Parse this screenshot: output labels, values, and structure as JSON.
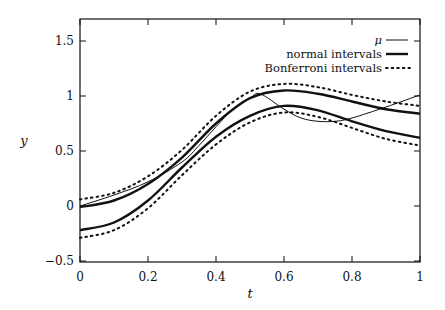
{
  "chart_data": {
    "type": "line",
    "title": "",
    "xlabel": "t",
    "ylabel": "y",
    "xlim": [
      0,
      1
    ],
    "ylim": [
      -0.5,
      1.7
    ],
    "grid": false,
    "legend_position": "upper right",
    "x_ticks": [
      "0",
      "0.2",
      "0.4",
      "0.6",
      "0.8",
      "1"
    ],
    "y_ticks": [
      "-0.5",
      "0",
      "0.5",
      "1",
      "1.5"
    ],
    "legend": [
      {
        "label": "μ",
        "style": "thin-solid"
      },
      {
        "label": "normal intervals",
        "style": "thick-solid"
      },
      {
        "label": "Bonferroni intervals",
        "style": "dotted"
      }
    ],
    "series": [
      {
        "name": "μ",
        "style": "thin-solid",
        "x": [
          0,
          0.1,
          0.2,
          0.3,
          0.35,
          0.4,
          0.45,
          0.5,
          0.53,
          0.6,
          0.65,
          0.7,
          0.75,
          0.8,
          0.9,
          1.0
        ],
        "y": [
          0.0,
          0.1,
          0.22,
          0.4,
          0.55,
          0.72,
          0.88,
          0.98,
          1.02,
          0.88,
          0.8,
          0.77,
          0.77,
          0.8,
          0.9,
          1.01
        ]
      },
      {
        "name": "normal intervals (upper)",
        "style": "thick-solid",
        "x": [
          0,
          0.1,
          0.2,
          0.3,
          0.4,
          0.5,
          0.6,
          0.7,
          0.8,
          0.9,
          1.0
        ],
        "y": [
          -0.01,
          0.05,
          0.2,
          0.44,
          0.75,
          0.98,
          1.05,
          1.02,
          0.95,
          0.88,
          0.84
        ]
      },
      {
        "name": "normal intervals (lower)",
        "style": "thick-solid",
        "x": [
          0,
          0.1,
          0.2,
          0.3,
          0.4,
          0.5,
          0.6,
          0.7,
          0.8,
          0.9,
          1.0
        ],
        "y": [
          -0.22,
          -0.15,
          0.05,
          0.35,
          0.63,
          0.82,
          0.91,
          0.87,
          0.77,
          0.68,
          0.62
        ]
      },
      {
        "name": "Bonferroni intervals (upper)",
        "style": "dotted",
        "x": [
          0,
          0.1,
          0.2,
          0.3,
          0.4,
          0.5,
          0.6,
          0.7,
          0.8,
          0.9,
          1.0
        ],
        "y": [
          0.06,
          0.12,
          0.27,
          0.51,
          0.82,
          1.04,
          1.11,
          1.08,
          1.01,
          0.95,
          0.91
        ]
      },
      {
        "name": "Bonferroni intervals (lower)",
        "style": "dotted",
        "x": [
          0,
          0.1,
          0.2,
          0.3,
          0.4,
          0.5,
          0.6,
          0.7,
          0.8,
          0.9,
          1.0
        ],
        "y": [
          -0.29,
          -0.22,
          -0.02,
          0.28,
          0.56,
          0.76,
          0.85,
          0.81,
          0.71,
          0.61,
          0.55
        ]
      }
    ]
  },
  "labels": {
    "xlabel": "t",
    "ylabel": "y",
    "legend_mu": "μ",
    "legend_normal": "normal intervals",
    "legend_bonferroni": "Bonferroni intervals",
    "xt0": "0",
    "xt1": "0.2",
    "xt2": "0.4",
    "xt3": "0.6",
    "xt4": "0.8",
    "xt5": "1",
    "yt0": "−0.5",
    "yt1": "0",
    "yt2": "0.5",
    "yt3": "1",
    "yt4": "1.5"
  }
}
